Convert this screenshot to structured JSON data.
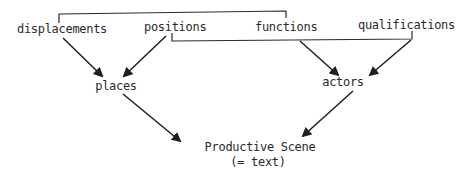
{
  "diagram": {
    "sources": {
      "displacements": "displacements",
      "positions": "positions",
      "functions": "functions",
      "qualifications": "qualifications"
    },
    "intermediates": {
      "places": "places",
      "actors": "actors"
    },
    "result": {
      "title": "Productive Scene",
      "subtitle": "(= text)"
    },
    "connections": [
      {
        "from": "displacements",
        "to": "places",
        "type": "arrow"
      },
      {
        "from": "positions",
        "to": "places",
        "type": "arrow"
      },
      {
        "from": "functions",
        "to": "actors",
        "type": "arrow"
      },
      {
        "from": "qualifications",
        "to": "actors",
        "type": "arrow"
      },
      {
        "from": "places",
        "to": "Productive Scene",
        "type": "arrow"
      },
      {
        "from": "actors",
        "to": "Productive Scene",
        "type": "arrow"
      },
      {
        "from": "displacements",
        "to": "functions",
        "type": "bracket"
      },
      {
        "from": "positions",
        "to": "qualifications",
        "type": "bracket"
      }
    ],
    "colors": {
      "ink": "#2a2a2a",
      "background": "#ffffff"
    }
  }
}
